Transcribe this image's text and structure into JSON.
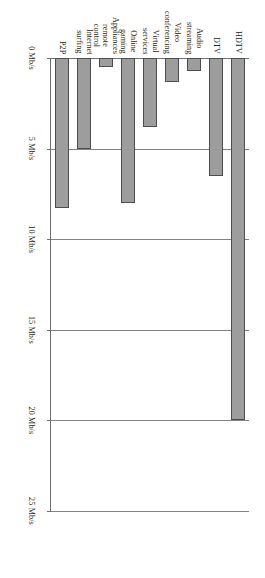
{
  "chart_data": {
    "type": "bar",
    "orientation": "horizontal",
    "title": "",
    "xlabel": "",
    "ylabel": "",
    "categories": [
      "HDTV",
      "DTV",
      "Audio\nstreaming",
      "Video\nconferencing",
      "Virtual\nservices",
      "Online\ngaming",
      "Appliances\nremote\ncontrol",
      "Internet\nsurfing",
      "P2P"
    ],
    "values": [
      20,
      6.5,
      0.7,
      1.3,
      3.8,
      8,
      0.5,
      5,
      8.3
    ],
    "unit": "Mb/s",
    "xlim": [
      0,
      25
    ],
    "tick_values": [
      0,
      5,
      10,
      15,
      20,
      25
    ],
    "tick_labels": [
      "0 Mb/s",
      "5 Mb/s",
      "10 Mb/s",
      "15 Mb/s",
      "20 Mb/s",
      "25 Mb/s"
    ],
    "grid": true,
    "legend": false,
    "bar_fill_color": "#9d9d9d",
    "bar_edge_color": "#4d4d4f",
    "axis_color": "#6d6e71",
    "grid_color": "#808285"
  }
}
